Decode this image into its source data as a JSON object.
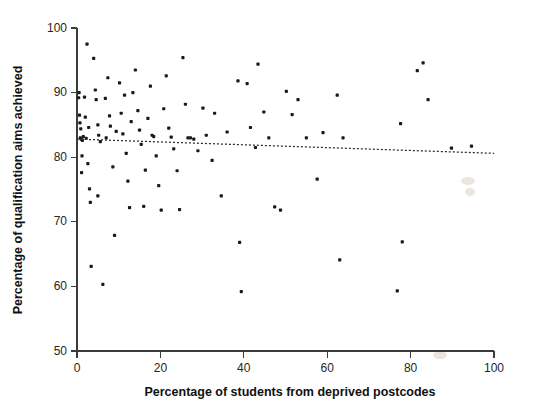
{
  "chart_data": {
    "type": "scatter",
    "title": "",
    "xlabel": "Percentage of students from deprived postcodes",
    "ylabel": "Percentage of qualification aims achieved",
    "xlim": [
      0,
      100
    ],
    "ylim": [
      50,
      100
    ],
    "xticks": [
      0,
      20,
      40,
      60,
      80,
      100
    ],
    "yticks": [
      50,
      60,
      70,
      80,
      90,
      100
    ],
    "xtick_labels": [
      "0",
      "20",
      "40",
      "60",
      "80",
      "100"
    ],
    "ytick_labels": [
      "50",
      "60",
      "70",
      "80",
      "90",
      "100"
    ],
    "grid": false,
    "legend": null,
    "marker": "filled-square",
    "marker_color": "#1a1a1a",
    "marker_size": 3.2,
    "trendline": {
      "type": "linear",
      "style": "dotted",
      "color": "#2b2b2b",
      "x_start": 0,
      "y_start": 82.8,
      "x_end": 100,
      "y_end": 80.6
    },
    "points": [
      [
        0.4,
        89.2
      ],
      [
        0.6,
        86.5
      ],
      [
        0.7,
        85.3
      ],
      [
        0.9,
        84.4
      ],
      [
        0.8,
        83.0
      ],
      [
        1.0,
        82.8
      ],
      [
        1.2,
        80.2
      ],
      [
        1.1,
        77.6
      ],
      [
        1.3,
        82.6
      ],
      [
        1.5,
        83.2
      ],
      [
        0.5,
        90.0
      ],
      [
        1.8,
        89.3
      ],
      [
        2.0,
        86.2
      ],
      [
        2.4,
        97.5
      ],
      [
        2.6,
        79.0
      ],
      [
        2.2,
        82.9
      ],
      [
        3.0,
        75.1
      ],
      [
        3.2,
        73.0
      ],
      [
        3.4,
        63.1
      ],
      [
        2.8,
        84.6
      ],
      [
        4.0,
        95.3
      ],
      [
        4.4,
        90.4
      ],
      [
        4.6,
        88.9
      ],
      [
        5.0,
        85.0
      ],
      [
        5.2,
        83.4
      ],
      [
        5.6,
        82.4
      ],
      [
        5.0,
        74.0
      ],
      [
        6.2,
        60.3
      ],
      [
        6.8,
        89.1
      ],
      [
        7.0,
        83.0
      ],
      [
        7.4,
        92.3
      ],
      [
        7.8,
        86.4
      ],
      [
        8.0,
        84.8
      ],
      [
        8.6,
        78.5
      ],
      [
        9.0,
        67.9
      ],
      [
        9.4,
        84.0
      ],
      [
        10.2,
        91.5
      ],
      [
        10.6,
        86.8
      ],
      [
        11.0,
        83.6
      ],
      [
        11.4,
        89.6
      ],
      [
        11.8,
        80.6
      ],
      [
        12.2,
        76.3
      ],
      [
        12.6,
        72.2
      ],
      [
        13.0,
        85.5
      ],
      [
        13.4,
        90.0
      ],
      [
        14.0,
        93.5
      ],
      [
        14.6,
        87.2
      ],
      [
        15.0,
        84.2
      ],
      [
        15.4,
        82.0
      ],
      [
        16.0,
        72.4
      ],
      [
        16.4,
        78.0
      ],
      [
        17.0,
        86.0
      ],
      [
        17.6,
        91.0
      ],
      [
        18.0,
        83.4
      ],
      [
        18.4,
        83.2
      ],
      [
        19.0,
        80.2
      ],
      [
        19.6,
        75.6
      ],
      [
        20.2,
        71.8
      ],
      [
        20.8,
        87.5
      ],
      [
        21.4,
        92.6
      ],
      [
        22.0,
        84.5
      ],
      [
        22.6,
        83.1
      ],
      [
        23.2,
        81.3
      ],
      [
        24.0,
        77.9
      ],
      [
        24.6,
        71.9
      ],
      [
        25.4,
        95.4
      ],
      [
        26.0,
        88.2
      ],
      [
        26.6,
        83.0
      ],
      [
        27.2,
        83.0
      ],
      [
        28.0,
        82.8
      ],
      [
        29.0,
        81.0
      ],
      [
        30.2,
        87.6
      ],
      [
        31.0,
        83.4
      ],
      [
        32.4,
        79.5
      ],
      [
        33.0,
        86.8
      ],
      [
        34.6,
        74.0
      ],
      [
        36.0,
        83.9
      ],
      [
        38.6,
        91.8
      ],
      [
        39.0,
        66.8
      ],
      [
        39.4,
        59.2
      ],
      [
        40.8,
        91.4
      ],
      [
        41.6,
        84.6
      ],
      [
        42.8,
        81.5
      ],
      [
        43.4,
        94.4
      ],
      [
        44.8,
        87.0
      ],
      [
        46.0,
        83.0
      ],
      [
        47.4,
        72.3
      ],
      [
        48.8,
        71.8
      ],
      [
        50.2,
        90.2
      ],
      [
        51.6,
        86.6
      ],
      [
        53.0,
        88.9
      ],
      [
        55.0,
        83.0
      ],
      [
        57.6,
        76.6
      ],
      [
        59.0,
        83.8
      ],
      [
        62.4,
        89.6
      ],
      [
        63.0,
        64.1
      ],
      [
        63.8,
        83.0
      ],
      [
        76.8,
        59.3
      ],
      [
        77.6,
        85.2
      ],
      [
        78.0,
        66.9
      ],
      [
        81.6,
        93.4
      ],
      [
        83.0,
        94.6
      ],
      [
        84.2,
        88.9
      ],
      [
        89.8,
        81.4
      ],
      [
        94.6,
        81.7
      ]
    ]
  }
}
